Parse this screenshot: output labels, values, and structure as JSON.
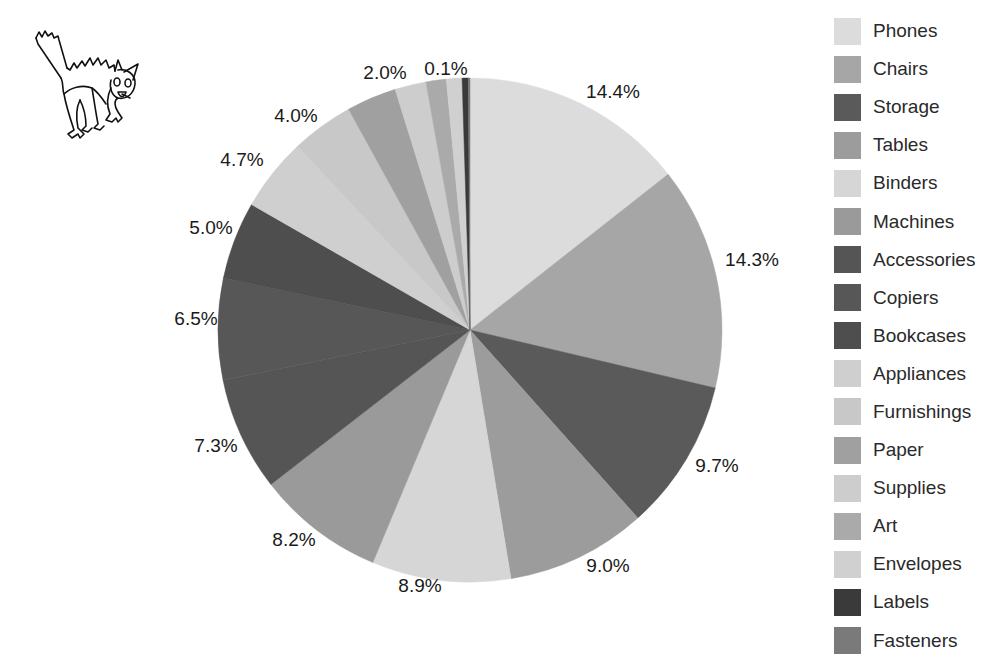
{
  "chart_data": {
    "type": "pie",
    "title": "",
    "start_angle_deg": 0,
    "direction": "clockwise",
    "legend_position": "right",
    "categories": [
      "Phones",
      "Chairs",
      "Storage",
      "Tables",
      "Binders",
      "Machines",
      "Accessories",
      "Copiers",
      "Bookcases",
      "Appliances",
      "Furnishings",
      "Paper",
      "Supplies",
      "Art",
      "Envelopes",
      "Labels",
      "Fasteners"
    ],
    "values": [
      14.4,
      14.3,
      9.7,
      9.0,
      8.9,
      8.2,
      7.3,
      6.5,
      5.0,
      4.7,
      4.0,
      3.2,
      2.0,
      1.3,
      1.0,
      0.4,
      0.1
    ],
    "data_labels": [
      "14.4%",
      "14.3%",
      "9.7%",
      "9.0%",
      "8.9%",
      "8.2%",
      "7.3%",
      "6.5%",
      "5.0%",
      "4.7%",
      "4.0%",
      "",
      "2.0%",
      "",
      "",
      "",
      "0.1%"
    ],
    "colors": [
      "#dcdcdc",
      "#a6a6a6",
      "#5a5a5a",
      "#9c9c9c",
      "#d6d6d6",
      "#9a9a9a",
      "#555555",
      "#575757",
      "#4e4e4e",
      "#cfcfcf",
      "#c8c8c8",
      "#a0a0a0",
      "#cdcdcd",
      "#aaaaaa",
      "#d0d0d0",
      "#3a3a3a",
      "#7a7a7a"
    ],
    "label_positions": [
      {
        "x": 613,
        "y": 92
      },
      {
        "x": 752,
        "y": 260
      },
      {
        "x": 717,
        "y": 466
      },
      {
        "x": 608,
        "y": 566
      },
      {
        "x": 420,
        "y": 586
      },
      {
        "x": 294,
        "y": 540
      },
      {
        "x": 216,
        "y": 446
      },
      {
        "x": 196,
        "y": 319
      },
      {
        "x": 211,
        "y": 228
      },
      {
        "x": 242,
        "y": 160
      },
      {
        "x": 296,
        "y": 116
      },
      null,
      {
        "x": 385,
        "y": 73
      },
      null,
      null,
      null,
      {
        "x": 446,
        "y": 69
      }
    ]
  },
  "pie": {
    "cx": 470,
    "cy": 330,
    "r": 252
  },
  "legend": {
    "items": [
      {
        "label": "Phones",
        "color": "#dcdcdc"
      },
      {
        "label": "Chairs",
        "color": "#a6a6a6"
      },
      {
        "label": "Storage",
        "color": "#5a5a5a"
      },
      {
        "label": "Tables",
        "color": "#9c9c9c"
      },
      {
        "label": "Binders",
        "color": "#d6d6d6"
      },
      {
        "label": "Machines",
        "color": "#9a9a9a"
      },
      {
        "label": "Accessories",
        "color": "#555555"
      },
      {
        "label": "Copiers",
        "color": "#575757"
      },
      {
        "label": "Bookcases",
        "color": "#4e4e4e"
      },
      {
        "label": "Appliances",
        "color": "#cfcfcf"
      },
      {
        "label": "Furnishings",
        "color": "#c8c8c8"
      },
      {
        "label": "Paper",
        "color": "#a0a0a0"
      },
      {
        "label": "Supplies",
        "color": "#cdcdcd"
      },
      {
        "label": "Art",
        "color": "#aaaaaa"
      },
      {
        "label": "Envelopes",
        "color": "#d0d0d0"
      },
      {
        "label": "Labels",
        "color": "#3a3a3a"
      },
      {
        "label": "Fasteners",
        "color": "#7a7a7a"
      }
    ]
  },
  "decoration": {
    "icon": "scared-cat-icon"
  }
}
